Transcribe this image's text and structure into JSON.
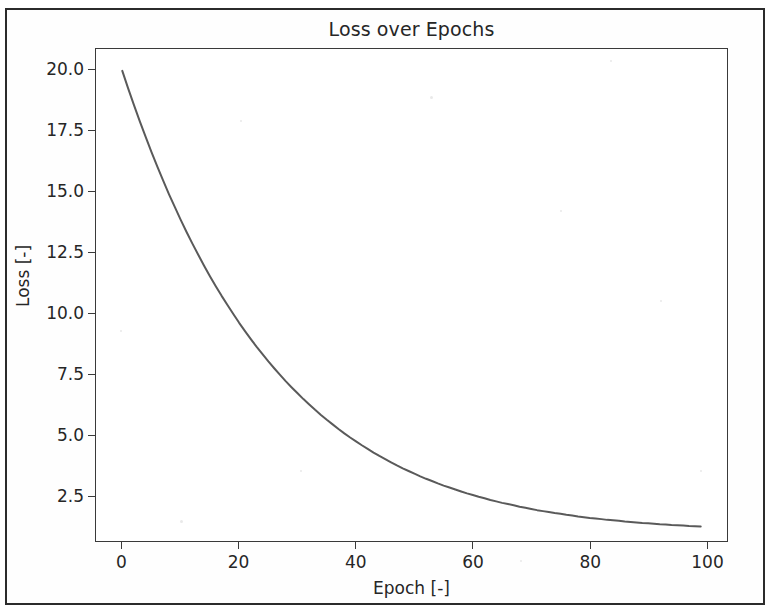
{
  "chart_data": {
    "type": "line",
    "title": "Loss over Epochs",
    "xlabel": "Epoch [-]",
    "ylabel": "Loss [-]",
    "xlim": [
      -4.5,
      103.5
    ],
    "ylim": [
      0.65,
      20.9
    ],
    "grid": false,
    "legend": null,
    "line_color": "#5a5a5a",
    "line_width": 2.0,
    "x_ticks": [
      0,
      20,
      40,
      60,
      80,
      100
    ],
    "x_tick_labels": [
      "0",
      "20",
      "40",
      "60",
      "80",
      "100"
    ],
    "y_ticks": [
      2.5,
      5.0,
      7.5,
      10.0,
      12.5,
      15.0,
      17.5,
      20.0
    ],
    "y_tick_labels": [
      "2.5",
      "5.0",
      "7.5",
      "10.0",
      "12.5",
      "15.0",
      "17.5",
      "20.0"
    ],
    "series": [
      {
        "name": "loss",
        "x": [
          0,
          1,
          2,
          3,
          4,
          5,
          6,
          7,
          8,
          9,
          10,
          11,
          12,
          13,
          14,
          15,
          16,
          17,
          18,
          19,
          20,
          21,
          22,
          23,
          24,
          25,
          26,
          27,
          28,
          29,
          30,
          31,
          32,
          33,
          34,
          35,
          36,
          37,
          38,
          39,
          40,
          41,
          42,
          43,
          44,
          45,
          46,
          47,
          48,
          49,
          50,
          51,
          52,
          53,
          54,
          55,
          56,
          57,
          58,
          59,
          60,
          61,
          62,
          63,
          64,
          65,
          66,
          67,
          68,
          69,
          70,
          71,
          72,
          73,
          74,
          75,
          76,
          77,
          78,
          79,
          80,
          81,
          82,
          83,
          84,
          85,
          86,
          87,
          88,
          89,
          90,
          91,
          92,
          93,
          94,
          95,
          96,
          97,
          98,
          99
        ],
        "y": [
          20.0,
          19.28,
          18.59,
          17.92,
          17.28,
          16.66,
          16.06,
          15.48,
          14.92,
          14.39,
          13.87,
          13.37,
          12.89,
          12.43,
          11.98,
          11.55,
          11.14,
          10.74,
          10.36,
          9.99,
          9.63,
          9.29,
          8.96,
          8.64,
          8.34,
          8.04,
          7.76,
          7.49,
          7.22,
          6.97,
          6.73,
          6.49,
          6.27,
          6.05,
          5.84,
          5.64,
          5.45,
          5.26,
          5.08,
          4.91,
          4.75,
          4.59,
          4.44,
          4.29,
          4.15,
          4.02,
          3.89,
          3.76,
          3.64,
          3.53,
          3.42,
          3.31,
          3.21,
          3.12,
          3.02,
          2.93,
          2.85,
          2.77,
          2.69,
          2.61,
          2.54,
          2.47,
          2.41,
          2.34,
          2.28,
          2.22,
          2.17,
          2.12,
          2.06,
          2.02,
          1.97,
          1.92,
          1.88,
          1.84,
          1.8,
          1.77,
          1.73,
          1.7,
          1.66,
          1.63,
          1.6,
          1.58,
          1.55,
          1.52,
          1.5,
          1.48,
          1.45,
          1.43,
          1.41,
          1.39,
          1.38,
          1.36,
          1.34,
          1.33,
          1.31,
          1.3,
          1.29,
          1.27,
          1.26,
          1.25
        ]
      }
    ]
  }
}
